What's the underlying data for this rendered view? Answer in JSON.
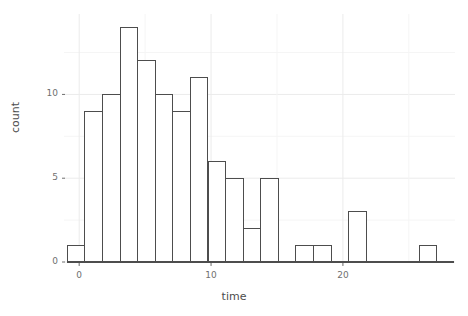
{
  "chart_data": {
    "type": "bar",
    "title": "",
    "subtitle": "",
    "xlabel": "time",
    "ylabel": "count",
    "grid": true,
    "legend": false,
    "xlim": [
      -1.0,
      28.5
    ],
    "ylim": [
      0,
      14.8
    ],
    "xticks": [
      0,
      10,
      20
    ],
    "xtick_labels": [
      "0",
      "10",
      "20"
    ],
    "yticks": [
      0,
      5,
      10
    ],
    "ytick_labels": [
      "0",
      "5",
      "10"
    ],
    "bin_width": 1.333,
    "bin_starts": [
      -0.9,
      0.43,
      1.77,
      3.1,
      4.43,
      5.77,
      7.1,
      8.43,
      9.77,
      11.1,
      12.43,
      13.77,
      15.1,
      16.43,
      17.77,
      19.1,
      20.43,
      21.77,
      23.1,
      24.43,
      25.77,
      27.1
    ],
    "categories": [
      "-0.9",
      "0.4",
      "1.8",
      "3.1",
      "4.4",
      "5.8",
      "7.1",
      "8.4",
      "9.8",
      "11.1",
      "12.4",
      "13.8",
      "15.1",
      "16.4",
      "17.8",
      "19.1",
      "20.4",
      "21.8",
      "23.1",
      "24.4",
      "25.8",
      "27.1"
    ],
    "values": [
      1,
      9,
      10,
      14,
      12,
      10,
      9,
      11,
      6,
      5,
      2,
      5,
      0,
      1,
      1,
      0,
      3,
      0,
      0,
      0,
      1,
      0
    ],
    "bar_fill": "#ffffff",
    "bar_stroke": "#4d4d4d",
    "grid_color": "#ebebeb",
    "axis_color": "#4d4d4d",
    "background": "#ffffff"
  },
  "colors": {
    "panel_background": "#ffffff",
    "grid_major": "#ebebeb",
    "grid_minor": "#f5f5f5",
    "text": "#4d4d4d",
    "tick_text": "#707070"
  }
}
